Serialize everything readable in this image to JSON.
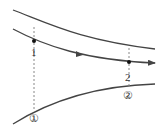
{
  "diagram": {
    "type": "streamline-in-converging-tube",
    "colors": {
      "line": "#444444",
      "dashed": "#888888",
      "label": "#333333",
      "background": "#ffffff"
    },
    "points": [
      {
        "id": "1",
        "label": "1",
        "x": 34,
        "y": 41
      },
      {
        "id": "2",
        "label": "2",
        "x": 129,
        "y": 62
      }
    ],
    "sections": [
      {
        "id": "section-1",
        "label": "①",
        "x": 34
      },
      {
        "id": "section-2",
        "label": "②",
        "x": 129
      }
    ],
    "flow_direction": "left-to-right"
  }
}
